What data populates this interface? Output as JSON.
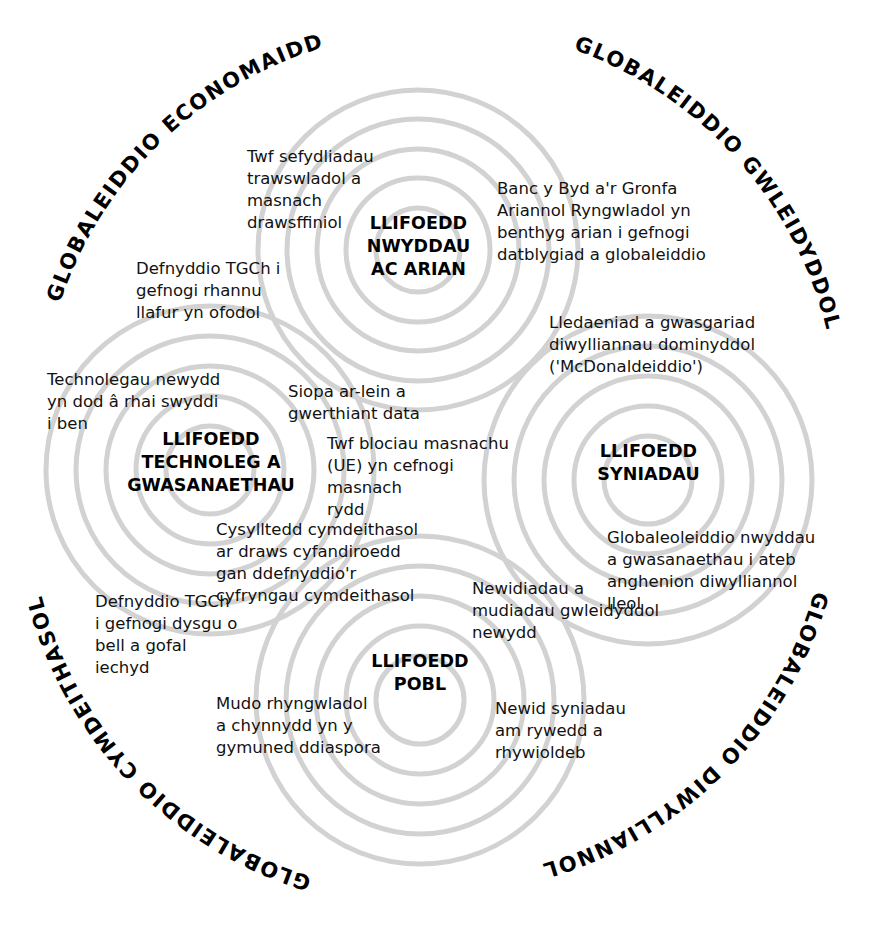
{
  "diagram": {
    "background_color": "#ffffff",
    "ring_color": "#d2d2d2",
    "text_color": "#121212",
    "heading_color": "#000000"
  },
  "arc_labels": [
    {
      "id": "economaidd",
      "text": "GLOBALEIDDIO ECONOMAIDD"
    },
    {
      "id": "gwleidyddol",
      "text": "GLOBALEIDDIO GWLEIDYDDOL"
    },
    {
      "id": "diwylliannol",
      "text": "GLOBALEIDDIO DIWYLLIANNOL"
    },
    {
      "id": "cymdeithasol",
      "text": "GLOBALEIDDIO CYMDEITHASOL"
    }
  ],
  "nodes": [
    {
      "id": "nwyddau-ac-arian",
      "label": "LLIFOEDD\nNWYDDAU\nAC ARIAN"
    },
    {
      "id": "technoleg-a-gwasanaethau",
      "label": "LLIFOEDD\nTECHNOLEG A\nGWASANAETHAU"
    },
    {
      "id": "syniadau",
      "label": "LLIFOEDD\nSYNIADAU"
    },
    {
      "id": "pobl",
      "label": "LLIFOEDD\nPOBL"
    }
  ],
  "items": [
    {
      "id": "twf-sefydliadau",
      "text": "Twf sefydliadau\ntrawswladol a\nmasnach\ndrawsffiniol"
    },
    {
      "id": "banc-y-byd",
      "text": "Banc y Byd a'r Gronfa\nAriannol Ryngwladol yn\nbenthyg arian i gefnogi\ndatblygiad a globaleiddio"
    },
    {
      "id": "defnyddio-tgch-rhannu-llafur",
      "text": "Defnyddio TGCh i\ngefnogi rhannu\nllafur yn ofodol"
    },
    {
      "id": "lledaeniad-diwylliannau",
      "text": "Lledaeniad a gwasgariad\ndiwylliannau dominyddol\n('McDonaldeiddio')"
    },
    {
      "id": "technolegau-newydd",
      "text": "Technolegau newydd\nyn dod â rhai swyddi\ni ben"
    },
    {
      "id": "siopa-ar-lein",
      "text": "Siopa ar-lein a\ngwerthiant data"
    },
    {
      "id": "twf-blociau-masnachu",
      "text": "Twf blociau masnachu\n(UE) yn cefnogi masnach\nrydd"
    },
    {
      "id": "globaleoleiddio-nwyddau",
      "text": "Globaleoleiddio nwyddau\na gwasanaethau i ateb\nanghenion diwylliannol\nlleol"
    },
    {
      "id": "cysylltedd-cymdeithasol",
      "text": "Cysylltedd cymdeithasol\nar draws cyfandiroedd\ngan ddefnyddio'r\ncyfryngau cymdeithasol"
    },
    {
      "id": "newidiadau-mudiadau",
      "text": "Newidiadau a\nmudiadau gwleidyddol\nnewydd"
    },
    {
      "id": "defnyddio-tgch-dysgu",
      "text": "Defnyddio TGCh\ni gefnogi dysgu o\nbell a gofal\niechyd"
    },
    {
      "id": "mudo-rhyngwladol",
      "text": "Mudo rhyngwladol\na chynnydd yn y\ngymuned ddiaspora"
    },
    {
      "id": "newid-syniadau",
      "text": "Newid syniadau\nam rywedd a\nrhywioldeb"
    }
  ]
}
